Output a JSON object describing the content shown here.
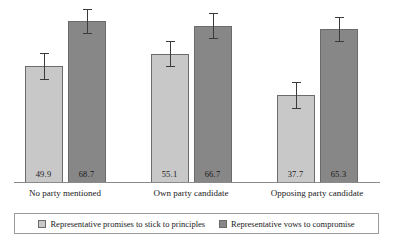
{
  "chart_data": {
    "type": "bar",
    "title": "",
    "subtitle": "",
    "xlabel": "",
    "ylabel": "",
    "ylim": [
      0,
      78
    ],
    "grid": false,
    "legend_position": "bottom",
    "categories": [
      "No party mentioned",
      "Own party candidate",
      "Opposing party candidate"
    ],
    "series": [
      {
        "name": "Representative promises to stick to principles",
        "color": "#c8c8c8",
        "values": [
          49.9,
          55.1,
          37.7
        ],
        "value_labels": [
          "49.9",
          "55.1",
          "37.7"
        ],
        "error_low": [
          44.5,
          49.8,
          32.3
        ],
        "error_high": [
          55.3,
          60.4,
          43.1
        ]
      },
      {
        "name": "Representative vows to compromise",
        "color": "#878787",
        "values": [
          68.7,
          66.7,
          65.3
        ],
        "value_labels": [
          "68.7",
          "66.7",
          "65.3"
        ],
        "error_low": [
          63.6,
          61.6,
          60.2
        ],
        "error_high": [
          73.8,
          71.8,
          70.4
        ]
      }
    ],
    "annotations": []
  },
  "legend": {
    "entries": [
      {
        "label": "Representative promises to stick to principles",
        "swatch": "light"
      },
      {
        "label": "Representative vows to compromise",
        "swatch": "dark"
      }
    ]
  },
  "colors": {
    "series_light": "#c8c8c8",
    "series_dark": "#878787",
    "bar_border": "#6b6b6b",
    "axis": "#8a8a8a",
    "error_bar": "#3a3a3a",
    "text": "#1a1a1a",
    "background": "#ffffff"
  },
  "layout": {
    "baseline_y": 182,
    "value_zero_y": 186,
    "px_per_unit": 2.404,
    "group_centers_x": [
      65,
      191,
      317
    ],
    "bar_width": 38,
    "bar_gap": 5
  }
}
